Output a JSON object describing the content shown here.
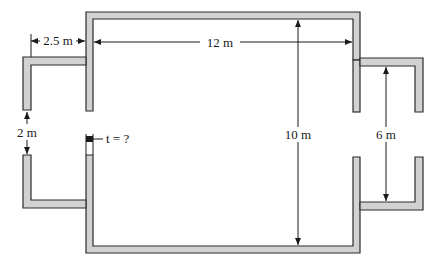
{
  "diagram": {
    "type": "cross-section of wall / duct with side chambers",
    "colors": {
      "wall_fill": "#d2d2d2",
      "wall_stroke": "#2b2b2b",
      "dimension_line": "#1a1a1a",
      "background": "#ffffff"
    },
    "labels": {
      "left_extension_length": "2.5 m",
      "main_width": "12 m",
      "main_height": "10 m",
      "left_opening": "2 m",
      "right_opening": "6 m",
      "wall_thickness": "t = ?"
    }
  }
}
